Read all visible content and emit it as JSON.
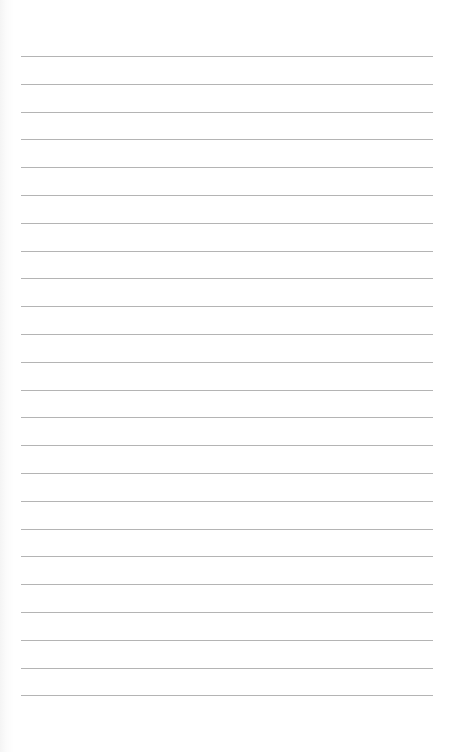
{
  "document": {
    "type": "lined-paper",
    "background_color": "#ffffff",
    "line_color": "#b4b4b4",
    "line_count": 24,
    "first_line_y": 56,
    "line_spacing": 27.8,
    "line_left": 21,
    "line_right": 433
  }
}
